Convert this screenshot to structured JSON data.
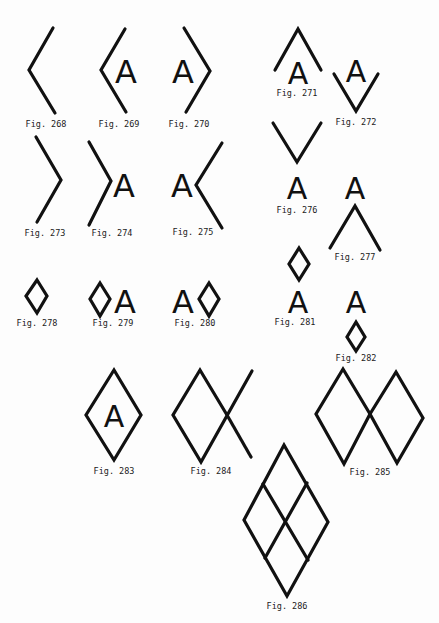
{
  "page": {
    "background": "#fdfdfd",
    "stroke_color": "#111111"
  },
  "figures": [
    {
      "id": "268",
      "caption": "Fig. 268",
      "description": "left-pointing chevron"
    },
    {
      "id": "269",
      "caption": "Fig. 269",
      "description": "left chevron before letter A"
    },
    {
      "id": "270",
      "caption": "Fig. 270",
      "description": "letter A before right chevron"
    },
    {
      "id": "271",
      "caption": "Fig. 271",
      "description": "upward chevron above letter A"
    },
    {
      "id": "272",
      "caption": "Fig. 272",
      "description": "letter A above downward chevron"
    },
    {
      "id": "273",
      "caption": "Fig. 273",
      "description": "right-pointing chevron"
    },
    {
      "id": "274",
      "caption": "Fig. 274",
      "description": "right chevron before letter A"
    },
    {
      "id": "275",
      "caption": "Fig. 275",
      "description": "letter A before left chevron"
    },
    {
      "id": "276",
      "caption": "Fig. 276",
      "description": "downward chevron above letter A"
    },
    {
      "id": "277",
      "caption": "Fig. 277",
      "description": "letter A above upward chevron"
    },
    {
      "id": "278",
      "caption": "Fig. 278",
      "description": "small diamond"
    },
    {
      "id": "279",
      "caption": "Fig. 279",
      "description": "small diamond before letter A"
    },
    {
      "id": "280",
      "caption": "Fig. 280",
      "description": "letter A before small diamond"
    },
    {
      "id": "281",
      "caption": "Fig. 281",
      "description": "small diamond above letter A"
    },
    {
      "id": "282",
      "caption": "Fig. 282",
      "description": "letter A above small diamond"
    },
    {
      "id": "283",
      "caption": "Fig. 283",
      "description": "letter A enclosed in diamond"
    },
    {
      "id": "284",
      "caption": "Fig. 284",
      "description": "diamond with extended crossing lines"
    },
    {
      "id": "285",
      "caption": "Fig. 285",
      "description": "two diamonds joined at a point"
    },
    {
      "id": "286",
      "caption": "Fig. 286",
      "description": "large diamond divided into four diamonds"
    }
  ],
  "glyphs": {
    "letter": "A"
  }
}
